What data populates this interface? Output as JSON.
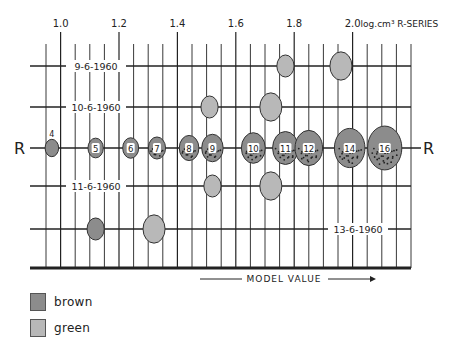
{
  "chart_data": {
    "type": "scatter",
    "title": "",
    "x_axis": {
      "label": "log.cm³ R-SERIES",
      "range": [
        0.95,
        2.2
      ],
      "minor_step": 0.05,
      "tick_labels": [
        "1.0",
        "1.2",
        "1.4",
        "1.6",
        "1.8",
        "2.0"
      ],
      "tick_values": [
        1.0,
        1.2,
        1.4,
        1.6,
        1.8,
        2.0
      ]
    },
    "bottom_annotation": "MODEL VALUE",
    "rows": [
      {
        "name": "9-6-1960",
        "label_side": "left",
        "points": [
          {
            "x": 1.77,
            "color": "green",
            "size": 1.8
          },
          {
            "x": 1.96,
            "color": "green",
            "size": 2.6
          }
        ]
      },
      {
        "name": "10-6-1960",
        "label_side": "left",
        "points": [
          {
            "x": 1.51,
            "color": "green",
            "size": 1.8
          },
          {
            "x": 1.72,
            "color": "green",
            "size": 2.6
          }
        ]
      },
      {
        "name": "R",
        "label_side": "both",
        "is_reference_series": true,
        "points": [
          {
            "x": 0.97,
            "label": "4",
            "color": "brown",
            "size": 1.2,
            "spotted": false
          },
          {
            "x": 1.12,
            "label": "5",
            "color": "brown",
            "size": 1.5,
            "spotted": false
          },
          {
            "x": 1.24,
            "label": "6",
            "color": "brown",
            "size": 1.6,
            "spotted": false
          },
          {
            "x": 1.33,
            "label": "7",
            "color": "brown",
            "size": 1.8,
            "spotted": true
          },
          {
            "x": 1.44,
            "label": "8",
            "color": "brown",
            "size": 2.2,
            "spotted": true
          },
          {
            "x": 1.52,
            "label": "9",
            "color": "brown",
            "size": 2.5,
            "spotted": true
          },
          {
            "x": 1.66,
            "label": "10",
            "color": "brown",
            "size": 2.9,
            "spotted": true
          },
          {
            "x": 1.77,
            "label": "11",
            "color": "brown",
            "size": 3.2,
            "spotted": true
          },
          {
            "x": 1.85,
            "label": "12",
            "color": "brown",
            "size": 3.5,
            "spotted": true
          },
          {
            "x": 1.99,
            "label": "14",
            "color": "brown",
            "size": 4.0,
            "spotted": true
          },
          {
            "x": 2.11,
            "label": "16",
            "color": "brown",
            "size": 4.6,
            "spotted": true
          }
        ]
      },
      {
        "name": "11-6-1960",
        "label_side": "left",
        "points": [
          {
            "x": 1.52,
            "color": "green",
            "size": 1.8
          },
          {
            "x": 1.72,
            "color": "green",
            "size": 2.6
          }
        ]
      },
      {
        "name": "13-6-1960",
        "label_side": "right",
        "points": [
          {
            "x": 1.12,
            "color": "brown",
            "size": 1.8
          },
          {
            "x": 1.32,
            "color": "green",
            "size": 2.6
          }
        ]
      }
    ],
    "legend": {
      "placement": "bottom-left",
      "entries": [
        {
          "label": "brown",
          "color": "#8c8c8c"
        },
        {
          "label": "green",
          "color": "#b8b8b8"
        }
      ]
    },
    "colors": {
      "brown": "#8c8c8c",
      "green": "#b8b8b8",
      "line": "#222222"
    },
    "grid": true
  }
}
